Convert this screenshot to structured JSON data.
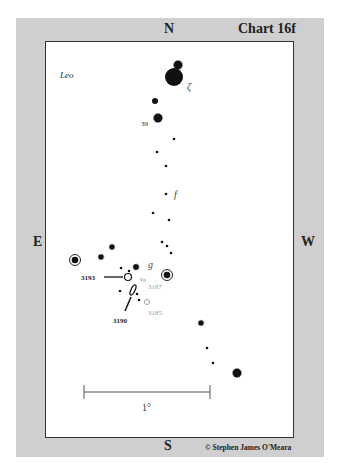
{
  "chart": {
    "title": "Chart 16f",
    "constellation": "Leo",
    "directions": {
      "north": "N",
      "south": "S",
      "east": "E",
      "west": "W"
    },
    "copyright": "© Stephen James O'Meara",
    "scale_bar_label": "1°",
    "star_labels": {
      "zeta": "ζ",
      "thirty_nine": "39",
      "f": "f",
      "g": "g"
    },
    "galaxy_labels": {
      "ngc3193": "3193",
      "ngc3190": "3190",
      "ngc3187": "3187",
      "ngc3185": "3185"
    }
  }
}
